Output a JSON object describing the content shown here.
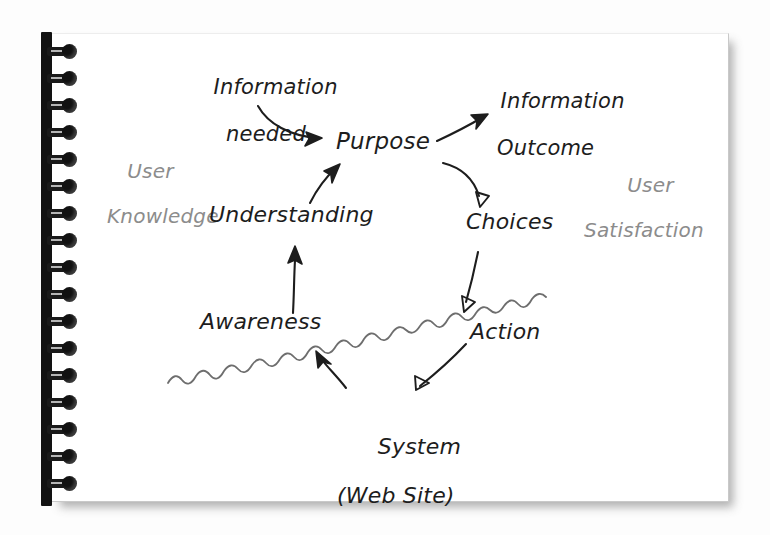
{
  "scene": {
    "medium": "hand-drawn sketch on a spiral-bound white notepad page",
    "ink_color": "#1d1d1d",
    "faint_ink_color": "#8c8c8c",
    "paper_color": "#ffffff",
    "background_color": "#fdfdfd",
    "binding_color": "#121212",
    "binding_coil_count": 18
  },
  "diagram": {
    "nodes": {
      "information_needed": {
        "label_line1": "Information",
        "label_line2": "needed"
      },
      "information_outcome": {
        "label_line1": "Information",
        "label_line2": "Outcome"
      },
      "purpose": {
        "label": "Purpose"
      },
      "understanding": {
        "label": "Understanding"
      },
      "choices": {
        "label": "Choices"
      },
      "awareness": {
        "label": "Awareness"
      },
      "action": {
        "label": "Action"
      },
      "system": {
        "label_line1": "System",
        "label_line2": "(Web Site)"
      }
    },
    "annotations": {
      "user_knowledge": {
        "label_line1": "User",
        "label_line2": "Knowledge"
      },
      "user_satisfaction": {
        "label_line1": "User",
        "label_line2": "Satisfaction"
      }
    },
    "edges": [
      {
        "from": "information_needed",
        "to": "purpose",
        "style": "curved-arrow"
      },
      {
        "from": "purpose",
        "to": "information_outcome",
        "style": "straight-arrow"
      },
      {
        "from": "purpose",
        "to": "choices",
        "style": "curved-arrow"
      },
      {
        "from": "choices",
        "to": "action",
        "style": "straight-arrow"
      },
      {
        "from": "action",
        "to": "system",
        "style": "straight-arrow-crossing-boundary"
      },
      {
        "from": "system",
        "to": "awareness",
        "style": "curved-arrow-crossing-boundary"
      },
      {
        "from": "awareness",
        "to": "understanding",
        "style": "curved-arrow"
      },
      {
        "from": "understanding",
        "to": "purpose",
        "style": "curved-arrow"
      }
    ],
    "boundary": {
      "name": "system-boundary-wavy-line",
      "description": "wavy horizontal line separating the user side from the system (web site) side"
    }
  }
}
